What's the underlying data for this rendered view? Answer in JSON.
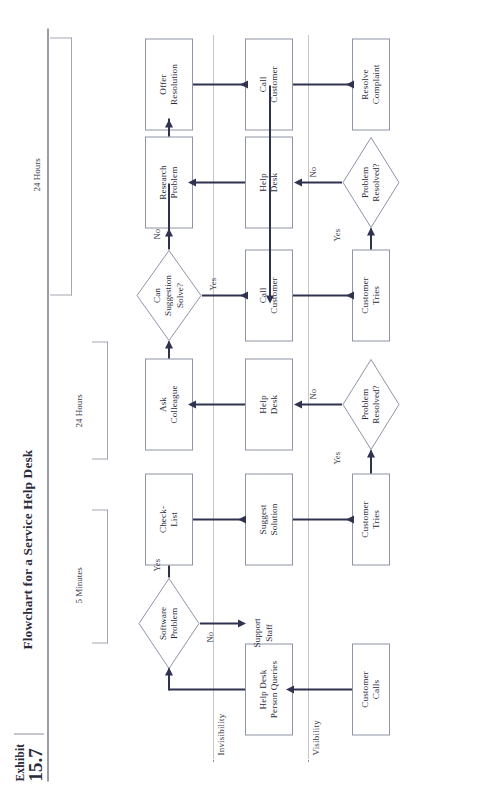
{
  "exhibit": {
    "label": "Exhibit",
    "number": "15.7",
    "title": "Flowchart for a Service Help Desk"
  },
  "lanes": [
    {
      "id": "visibility",
      "label": "Visibility"
    },
    {
      "id": "invisibility",
      "label": "Invisibility"
    }
  ],
  "nodes": [
    {
      "id": "customer-calls",
      "type": "process",
      "label": "Customer\nCalls"
    },
    {
      "id": "help-desk-queries",
      "type": "process",
      "label": "Help Desk\nPerson Queries"
    },
    {
      "id": "software-problem",
      "type": "decision",
      "label": "Software\nProblem"
    },
    {
      "id": "check-list",
      "type": "process",
      "label": "Check-\nList"
    },
    {
      "id": "suggest-solution",
      "type": "process",
      "label": "Suggest\nSolution"
    },
    {
      "id": "customer-tries-1",
      "type": "process",
      "label": "Customer\nTries"
    },
    {
      "id": "problem-resolved-1",
      "type": "decision",
      "label": "Problem\nResolved?"
    },
    {
      "id": "help-desk-1",
      "type": "process",
      "label": "Help\nDesk"
    },
    {
      "id": "ask-colleague",
      "type": "process",
      "label": "Ask\nColleague"
    },
    {
      "id": "can-suggestion-solve",
      "type": "decision",
      "label": "Can\nSuggestion\nSolve?"
    },
    {
      "id": "call-customer-1",
      "type": "process",
      "label": "Call\nCustomer"
    },
    {
      "id": "customer-tries-2",
      "type": "process",
      "label": "Customer\nTries"
    },
    {
      "id": "problem-resolved-2",
      "type": "decision",
      "label": "Problem\nResolved?"
    },
    {
      "id": "help-desk-2",
      "type": "process",
      "label": "Help\nDesk"
    },
    {
      "id": "research-problem",
      "type": "process",
      "label": "Research\nProblem"
    },
    {
      "id": "offer-resolution",
      "type": "process",
      "label": "Offer\nResolution"
    },
    {
      "id": "call-customer-2",
      "type": "process",
      "label": "Call\nCustomer"
    },
    {
      "id": "resolve-complaint",
      "type": "process",
      "label": "Resolve\nComplaint"
    }
  ],
  "endpoints": [
    {
      "id": "support-staff",
      "label": "Support\nStaff"
    },
    {
      "id": "yes-exit-1",
      "label": "Yes"
    },
    {
      "id": "yes-exit-2",
      "label": "Yes"
    }
  ],
  "branch_labels": {
    "software_problem_yes": "Yes",
    "software_problem_no": "No",
    "resolved1_yes": "Yes",
    "resolved1_no": "No",
    "suggestion_yes": "Yes",
    "suggestion_no": "No",
    "resolved2_yes": "Yes",
    "resolved2_no": "No"
  },
  "brackets": [
    {
      "id": "bracket-5-minutes",
      "label": "5 Minutes"
    },
    {
      "id": "bracket-24-hours-a",
      "label": "24 Hours"
    },
    {
      "id": "bracket-24-hours-b",
      "label": "24 Hours"
    }
  ],
  "colors": {
    "line": "#2f3350",
    "box_border": "#9094a6",
    "text": "#2b2b3c",
    "lane": "#8b8b99",
    "rule": "#9a9aa8"
  }
}
